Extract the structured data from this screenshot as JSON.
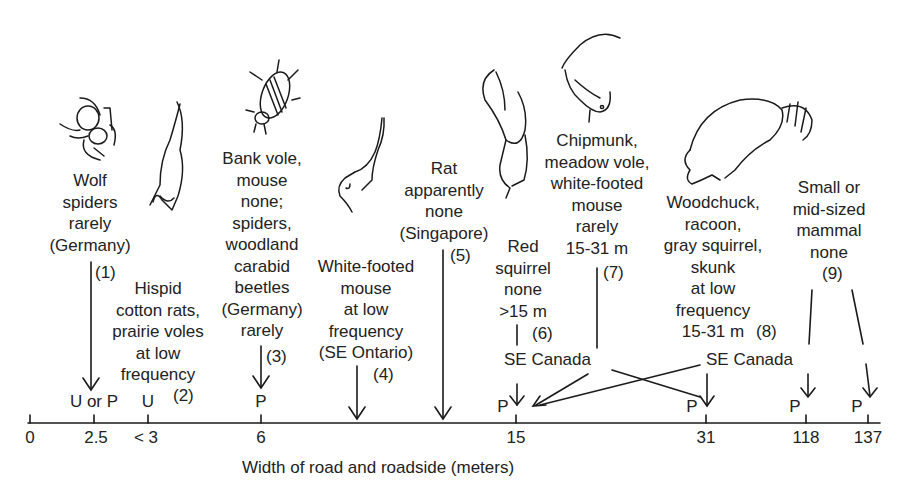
{
  "axis": {
    "label": "Width of road and roadside (meters)",
    "ticks": [
      {
        "label": "0",
        "x": 38
      },
      {
        "label": "2.5",
        "x": 94
      },
      {
        "label": "< 3",
        "x": 148
      },
      {
        "label": "6",
        "x": 261
      },
      {
        "label": "15",
        "x": 516
      },
      {
        "label": "31",
        "x": 706
      },
      {
        "label": "118",
        "x": 806
      },
      {
        "label": "137",
        "x": 868
      }
    ],
    "marks": [
      {
        "label": "U or P",
        "x": 94
      },
      {
        "label": "U",
        "x": 148
      },
      {
        "label": "P",
        "x": 261
      },
      {
        "label": "P",
        "x": 500
      },
      {
        "label": "P",
        "x": 690
      },
      {
        "label": "P",
        "x": 793
      },
      {
        "label": "P",
        "x": 855
      }
    ]
  },
  "entries": [
    {
      "id": 1,
      "text": "Wolf\nspiders\nrarely\n(Germany)",
      "number": "(1)",
      "animal": "spider"
    },
    {
      "id": 2,
      "text": "Hispid\ncotton rats,\nprairie voles\nat low\nfrequency",
      "number": "(2)",
      "animal": "rat"
    },
    {
      "id": 3,
      "text": "Bank vole,\nmouse\nnone;\nspiders,\nwoodland\ncarabid\nbeetles\n(Germany)\nrarely",
      "number": "(3)",
      "animal": "beetle"
    },
    {
      "id": 4,
      "text": "White-footed\nmouse\nat low\nfrequency\n(SE Ontario)",
      "number": "(4)",
      "animal": "mouse"
    },
    {
      "id": 5,
      "text": "Rat\napparently\nnone\n(Singapore)",
      "number": "(5)",
      "animal": "none"
    },
    {
      "id": 6,
      "text": "Red\nsquirrel\nnone\n>15 m",
      "number": "(6)",
      "animal": "squirrel"
    },
    {
      "id": 7,
      "text": "Chipmunk,\nmeadow vole,\nwhite-footed\nmouse\nrarely\n15-31 m",
      "number": "(7)",
      "animal": "chipmunk"
    },
    {
      "id": 8,
      "text": "Woodchuck,\nracoon,\ngray squirrel,\nskunk\nat low\nfrequency\n15-31 m",
      "number": "(8)",
      "animal": "raccoon"
    },
    {
      "id": 9,
      "text": "Small or\nmid-sized\nmammal\nnone",
      "number": "(9)",
      "animal": "none"
    }
  ],
  "regions": [
    {
      "label": "SE Canada",
      "position": "left"
    },
    {
      "label": "SE Canada",
      "position": "right"
    }
  ]
}
